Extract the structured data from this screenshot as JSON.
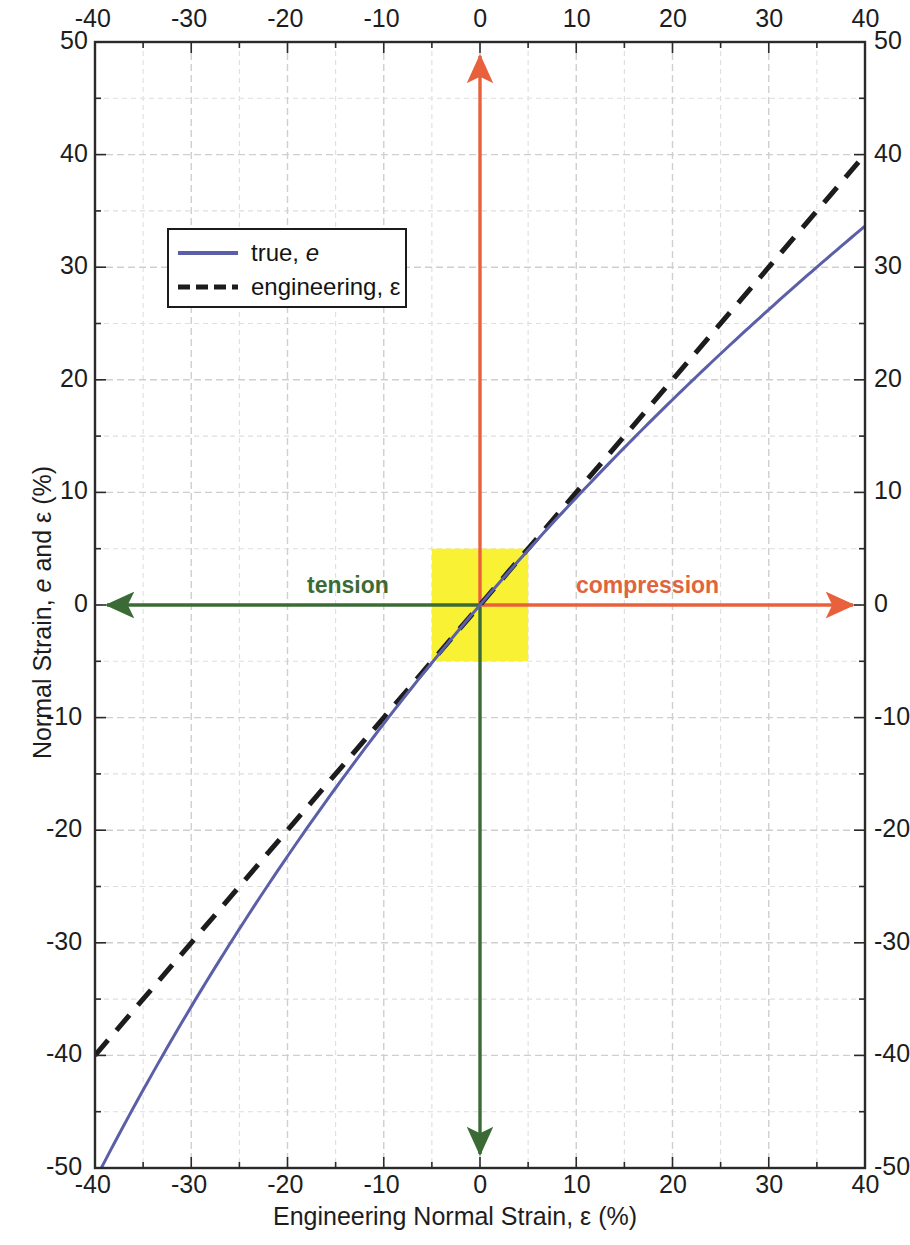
{
  "chart_data": {
    "type": "line",
    "title": "",
    "xlabel": "Engineering Normal Strain, ε (%)",
    "ylabel": "Normal Strain, e and ε (%)",
    "xlim": [
      -40,
      40
    ],
    "ylim": [
      -50,
      50
    ],
    "xticks": [
      -40,
      -30,
      -20,
      -10,
      0,
      10,
      20,
      30,
      40
    ],
    "yticks": [
      -50,
      -40,
      -30,
      -20,
      -10,
      0,
      10,
      20,
      30,
      40,
      50
    ],
    "xtick_labels": [
      "-40",
      "-30",
      "-20",
      "-10",
      "0",
      "10",
      "20",
      "30",
      "40"
    ],
    "ytick_labels": [
      "-50",
      "-40",
      "-30",
      "-20",
      "-10",
      "0",
      "10",
      "20",
      "30",
      "40",
      "50"
    ],
    "minor_tick_step": 5,
    "grid": true,
    "grid_style": "dashed",
    "grid_color": "#d9d9d9",
    "x_axis_top": true,
    "x_axis_bottom": true,
    "y_axis_left": true,
    "y_axis_right": true,
    "legend_position": "upper-left-inset",
    "series": [
      {
        "name": "true, e",
        "key": "true",
        "style": "solid",
        "color": "#5a5fa8",
        "width": 3,
        "formula": "e = 100*ln(1 + x/100)",
        "x": [
          -40,
          -35,
          -30,
          -25,
          -20,
          -15,
          -10,
          -5,
          0,
          5,
          10,
          15,
          20,
          25,
          30,
          35,
          40
        ],
        "y": [
          -51.08,
          -43.08,
          -35.67,
          -28.77,
          -22.31,
          -16.25,
          -10.54,
          -5.13,
          0,
          4.88,
          9.53,
          13.98,
          18.23,
          22.31,
          26.24,
          30.01,
          33.65
        ]
      },
      {
        "name": "engineering, ε",
        "key": "engineering",
        "style": "dashed",
        "color": "#1c1c1c",
        "width": 5,
        "formula": "ε = x",
        "x": [
          -40,
          -30,
          -20,
          -10,
          0,
          10,
          20,
          30,
          40
        ],
        "y": [
          -40,
          -30,
          -20,
          -10,
          0,
          10,
          20,
          30,
          40
        ]
      }
    ],
    "annotations": [
      {
        "name": "tension",
        "text": "tension",
        "color": "#3b6b35",
        "arrow": "left",
        "axis": "x-negative"
      },
      {
        "name": "compression",
        "text": "compression",
        "color": "#e0643c",
        "arrow": "right",
        "axis": "x-positive"
      },
      {
        "name": "up-arrow",
        "text": "",
        "color": "#e8603c",
        "arrow": "up",
        "axis": "y-positive"
      },
      {
        "name": "down-arrow",
        "text": "",
        "color": "#3b6b35",
        "arrow": "down",
        "axis": "y-negative"
      }
    ],
    "highlight_region": {
      "name": "small-strain-region",
      "color": "#f9f133",
      "x_range": [
        -5,
        5
      ],
      "y_range": [
        -5,
        5
      ]
    }
  },
  "legend": {
    "items": [
      {
        "label_prefix": "true, ",
        "label_symbol": "e",
        "label_full": "true, e"
      },
      {
        "label_prefix": "engineering, ",
        "label_symbol": "ε",
        "label_full": "engineering, ε"
      }
    ]
  }
}
